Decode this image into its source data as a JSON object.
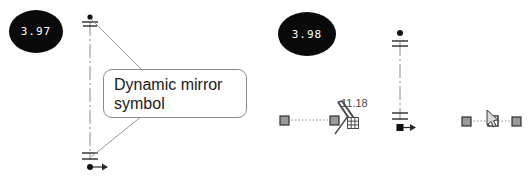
{
  "figure": {
    "background_color": "#ffffff",
    "line_color": "#3a3a3a",
    "grip_fill_color": "#9a9a9a",
    "badge_color": "#0a0a0a",
    "badge_text_color": "#ffffff"
  },
  "badges": [
    {
      "id": "badge-left",
      "value": "3.97"
    },
    {
      "id": "badge-right",
      "value": "3.98"
    }
  ],
  "callout": {
    "text": "Dynamic mirror symbol",
    "line1": "Dynamic mirror",
    "line2": "symbol"
  },
  "dimensions": [
    {
      "id": "mirror-distance",
      "value": "11.18"
    }
  ],
  "icons": {
    "grid": "grid-icon",
    "cursor": "cursor-arrow-icon",
    "mirror": "dynamic-mirror-icon",
    "centerline": "centerline-icon",
    "arrow": "arrow-right-icon"
  }
}
